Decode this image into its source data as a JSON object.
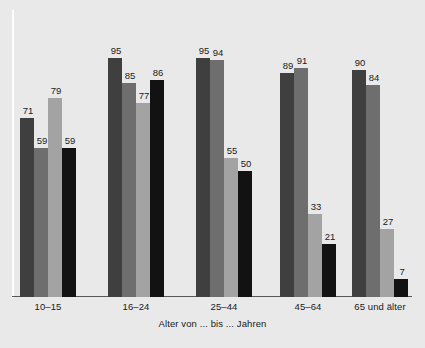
{
  "chart_data": {
    "type": "bar",
    "title": "",
    "subtitle": "",
    "xlabel": "Alter von ... bis ... Jahren",
    "ylabel": "",
    "ylim": [
      0,
      100
    ],
    "grid": false,
    "legend": "none",
    "categories": [
      "10–15",
      "16–24",
      "25–44",
      "45–64",
      "65 und älter"
    ],
    "series": [
      {
        "name": "series-1",
        "color": "#3f3f3f",
        "values": [
          71,
          95,
          95,
          89,
          90
        ]
      },
      {
        "name": "series-2",
        "color": "#6e6e6e",
        "values": [
          59,
          85,
          94,
          91,
          84
        ]
      },
      {
        "name": "series-3",
        "color": "#a3a3a3",
        "values": [
          79,
          77,
          55,
          33,
          27
        ]
      },
      {
        "name": "series-4",
        "color": "#121212",
        "values": [
          59,
          86,
          50,
          21,
          7
        ]
      }
    ],
    "groups": [
      {
        "category": "10–15",
        "bars": [
          {
            "value": 71,
            "color": "#3f3f3f",
            "label": "71"
          },
          {
            "value": 59,
            "color": "#6e6e6e",
            "label": "59"
          },
          {
            "value": 79,
            "color": "#a3a3a3",
            "label": "79"
          },
          {
            "value": 59,
            "color": "#121212",
            "label": "59"
          }
        ]
      },
      {
        "category": "16–24",
        "bars": [
          {
            "value": 95,
            "color": "#3f3f3f",
            "label": "95"
          },
          {
            "value": 85,
            "color": "#6e6e6e",
            "label": "85"
          },
          {
            "value": 77,
            "color": "#a3a3a3",
            "label": "77"
          },
          {
            "value": 86,
            "color": "#121212",
            "label": "86"
          }
        ]
      },
      {
        "category": "25–44",
        "bars": [
          {
            "value": 95,
            "color": "#3f3f3f",
            "label": "95"
          },
          {
            "value": 94,
            "color": "#6e6e6e",
            "label": "94"
          },
          {
            "value": 55,
            "color": "#a3a3a3",
            "label": "55"
          },
          {
            "value": 50,
            "color": "#121212",
            "label": "50"
          }
        ]
      },
      {
        "category": "45–64",
        "bars": [
          {
            "value": 89,
            "color": "#3f3f3f",
            "label": "89"
          },
          {
            "value": 91,
            "color": "#6e6e6e",
            "label": "91"
          },
          {
            "value": 33,
            "color": "#a3a3a3",
            "label": "33"
          },
          {
            "value": 21,
            "color": "#121212",
            "label": "21"
          }
        ]
      },
      {
        "category": "65 und älter",
        "bars": [
          {
            "value": 90,
            "color": "#3f3f3f",
            "label": "90"
          },
          {
            "value": 84,
            "color": "#6e6e6e",
            "label": "84"
          },
          {
            "value": 27,
            "color": "#a3a3a3",
            "label": "27"
          },
          {
            "value": 7,
            "color": "#121212",
            "label": "7"
          }
        ]
      }
    ],
    "background_color": "#e9e9e9",
    "axis_color": "#585858"
  },
  "layout": {
    "group_left_positions": [
      20,
      108,
      196,
      280,
      352
    ],
    "bar_width": 14,
    "plot_height": 287,
    "px_per_unit": 2.52
  }
}
